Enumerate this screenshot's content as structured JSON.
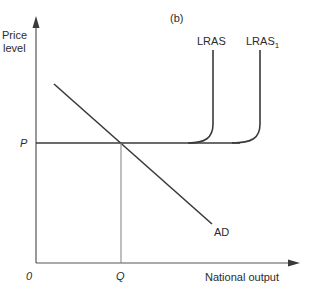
{
  "diagram": {
    "panel_label": "(b)",
    "y_axis_label_line1": "Price",
    "y_axis_label_line2": "level",
    "x_axis_label": "National output",
    "origin_label": "0",
    "price_label": "P",
    "quantity_label": "Q",
    "curves": {
      "lras": "LRAS",
      "lras1_base": "LRAS",
      "lras1_sub": "1",
      "ad": "AD"
    },
    "colors": {
      "background": "#ffffff",
      "line": "#3a3a3a",
      "axis": "#555555",
      "guide": "#8a8a8a",
      "text": "#2b2b2b"
    }
  }
}
